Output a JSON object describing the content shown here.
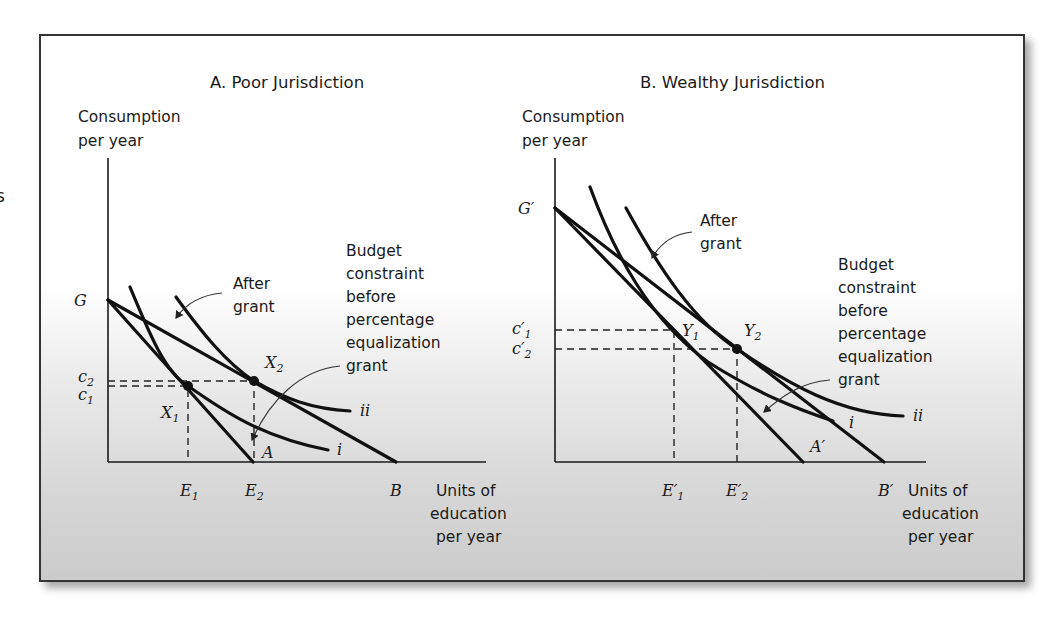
{
  "edge_fragment": "s",
  "panels": [
    {
      "id": "A",
      "title": "A.  Poor Jurisdiction",
      "y_axis_label": [
        "Consumption",
        "per year"
      ],
      "x_axis_label": [
        "Units of",
        "education",
        "per year"
      ],
      "intercept_labels": {
        "y": "G",
        "x_budget": "A",
        "x_after": "B"
      },
      "y_ticks": [
        {
          "main": "c",
          "sub": "2"
        },
        {
          "main": "c",
          "sub": "1"
        }
      ],
      "x_ticks": [
        {
          "main": "E",
          "sub": "1"
        },
        {
          "main": "E",
          "sub": "2"
        }
      ],
      "points": [
        {
          "main": "X",
          "sub": "1"
        },
        {
          "main": "X",
          "sub": "2"
        }
      ],
      "curves": {
        "low": "i",
        "high": "ii"
      },
      "annotations": {
        "after_grant": [
          "After",
          "grant"
        ],
        "budget_before": [
          "Budget",
          "constraint",
          "before",
          "percentage",
          "equalization",
          "grant"
        ]
      }
    },
    {
      "id": "B",
      "title": "B.  Wealthy Jurisdiction",
      "y_axis_label": [
        "Consumption",
        "per year"
      ],
      "x_axis_label": [
        "Units of",
        "education",
        "per year"
      ],
      "intercept_labels": {
        "y": "G′",
        "x_budget": "A′",
        "x_after": "B′"
      },
      "y_ticks": [
        {
          "main": "c′",
          "sub": "1"
        },
        {
          "main": "c′",
          "sub": "2"
        }
      ],
      "x_ticks": [
        {
          "main": "E′",
          "sub": "1"
        },
        {
          "main": "E′",
          "sub": "2"
        }
      ],
      "points": [
        {
          "main": "Y",
          "sub": "1"
        },
        {
          "main": "Y",
          "sub": "2"
        }
      ],
      "curves": {
        "low": "i",
        "high": "ii"
      },
      "annotations": {
        "after_grant": [
          "After",
          "grant"
        ],
        "budget_before": [
          "Budget",
          "constraint",
          "before",
          "percentage",
          "equalization",
          "grant"
        ]
      }
    }
  ],
  "colors": {
    "ink": "#111111",
    "frame_border": "#333333",
    "gradient_bottom": "#cbcbcb"
  }
}
